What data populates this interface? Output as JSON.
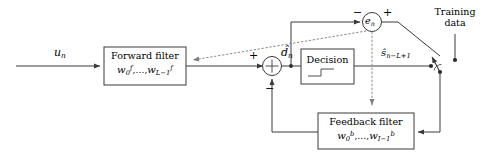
{
  "diagram": {
    "stroke_color": "#3a3a3a",
    "dotted_color": "#8a8a8a",
    "text_color": "#000000",
    "background": "#ffffff"
  },
  "signals": {
    "input": "u",
    "input_sub": "n",
    "soft_estimate": "d̂",
    "soft_estimate_sub": "n",
    "error": "e",
    "error_sub": "n",
    "decision_output": "ŝ",
    "decision_output_sub": "n−L+1"
  },
  "blocks": {
    "forward_filter": {
      "line1": "Forward filter",
      "coef_base": "w",
      "coef_first_sub": "0",
      "coef_sup": "f",
      "coef_ellipsis": ",…,",
      "coef_last_sub": "L−1"
    },
    "decision": {
      "label": "Decision",
      "glyph": "step-function"
    },
    "feedback_filter": {
      "line1": "Feedback filter",
      "coef_base": "w",
      "coef_first_sub": "0",
      "coef_sup": "b",
      "coef_ellipsis": ",…,",
      "coef_last_sub": "I−1"
    }
  },
  "junctions": {
    "summing": {
      "plus_label": "+",
      "minus_label": "−"
    },
    "error": {
      "minus_label": "−",
      "plus_label": "+"
    }
  },
  "training": {
    "line1": "Training",
    "line2": "data"
  }
}
